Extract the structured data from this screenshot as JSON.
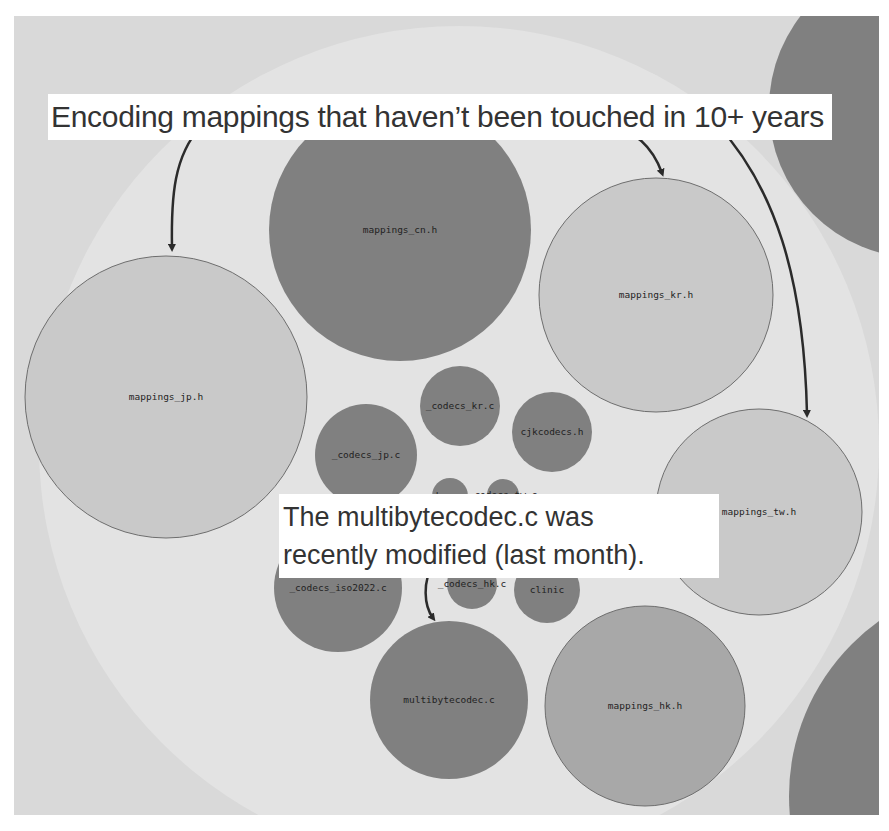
{
  "colors": {
    "frame_bg": "#d9d9d9",
    "parent_circle": "#e3e3e3",
    "old_file": "#c9c9c9",
    "recent_file": "#808080",
    "medium_file": "#a8a8a8",
    "outline": "#6e6e6e",
    "arrow": "#2b2b2b",
    "callout_bg": "#ffffff"
  },
  "annotations": {
    "top": "Encoding mappings that haven’t been touched in 10+ years",
    "middle_line1": "The multibytecodec.c was",
    "middle_line2": "recently modified (last month)."
  },
  "bubbles": [
    {
      "id": "mappings_cn",
      "label": "mappings_cn.h",
      "cx": 386,
      "cy": 214,
      "r": 131,
      "shade": "recent_file",
      "stroke": false
    },
    {
      "id": "mappings_kr",
      "label": "mappings_kr.h",
      "cx": 642,
      "cy": 279,
      "r": 117,
      "shade": "old_file",
      "stroke": true
    },
    {
      "id": "mappings_jp",
      "label": "mappings_jp.h",
      "cx": 152,
      "cy": 381,
      "r": 141,
      "shade": "old_file",
      "stroke": true
    },
    {
      "id": "mappings_tw",
      "label": "mappings_tw.h",
      "cx": 745,
      "cy": 496,
      "r": 103,
      "shade": "old_file",
      "stroke": true
    },
    {
      "id": "mappings_hk",
      "label": "mappings_hk.h",
      "cx": 631,
      "cy": 690,
      "r": 100,
      "shade": "medium_file",
      "stroke": true
    },
    {
      "id": "multibytecodec",
      "label": "multibytecodec.c",
      "cx": 435,
      "cy": 684,
      "r": 79,
      "shade": "recent_file",
      "stroke": false
    },
    {
      "id": "codecs_kr",
      "label": "_codecs_kr.c",
      "cx": 446,
      "cy": 390,
      "r": 40,
      "shade": "recent_file",
      "stroke": false
    },
    {
      "id": "cjkcodecs",
      "label": "cjkcodecs.h",
      "cx": 538,
      "cy": 416,
      "r": 40,
      "shade": "recent_file",
      "stroke": false
    },
    {
      "id": "codecs_jp",
      "label": "_codecs_jp.c",
      "cx": 352,
      "cy": 439,
      "r": 51,
      "shade": "recent_file",
      "stroke": false
    },
    {
      "id": "codecs_cn",
      "label": "_codecs_cn.c",
      "cx": 436,
      "cy": 480,
      "r": 18,
      "shade": "recent_file",
      "stroke": false
    },
    {
      "id": "codecs_tw",
      "label": "_codecs_tw.c",
      "cx": 489,
      "cy": 479,
      "r": 16,
      "shade": "recent_file",
      "stroke": false
    },
    {
      "id": "codecs_iso2022",
      "label": "_codecs_iso2022.c",
      "cx": 324,
      "cy": 572,
      "r": 64,
      "shade": "recent_file",
      "stroke": false
    },
    {
      "id": "codecs_hk",
      "label": "_codecs_hk.c",
      "cx": 458,
      "cy": 568,
      "r": 25,
      "shade": "recent_file",
      "stroke": false
    },
    {
      "id": "clinic",
      "label": "clinic",
      "cx": 533,
      "cy": 574,
      "r": 33,
      "shade": "recent_file",
      "stroke": false
    },
    {
      "id": "neighbor_top_right",
      "label": "",
      "cx": 905,
      "cy": 92,
      "r": 150,
      "shade": "recent_file",
      "stroke": false
    },
    {
      "id": "neighbor_bottom_right",
      "label": "",
      "cx": 990,
      "cy": 780,
      "r": 215,
      "shade": "recent_file",
      "stroke": false
    }
  ],
  "arrows": [
    {
      "id": "arrow-to-mappings-jp",
      "d": "M187 110 C 160 140, 157 180, 158 232"
    },
    {
      "id": "arrow-to-mappings-kr",
      "d": "M594 109 C 625 115, 640 135, 648 157"
    },
    {
      "id": "arrow-to-mappings-tw",
      "d": "M702 107 C 760 170, 790 260, 793 398"
    },
    {
      "id": "arrow-to-multibytecodec",
      "d": "M420 548 C 408 565, 410 590, 419 602"
    }
  ],
  "parent_circle": {
    "cx": 445,
    "cy": 430,
    "r": 420
  }
}
